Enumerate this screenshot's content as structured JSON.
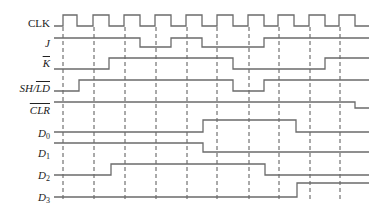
{
  "title": "",
  "colors": {
    "signal": "#6b6b6b",
    "dashed": "#555555",
    "label": "#222222"
  },
  "dashed_lines": {
    "x": [
      63,
      94,
      125,
      156,
      187,
      217,
      249,
      279,
      310,
      340
    ],
    "y_top": 27,
    "y_bottom": 200
  },
  "signals": [
    {
      "name": "CLK",
      "label": "CLK",
      "overline": false,
      "italic": false,
      "sub": "",
      "label_y": 23,
      "high_y": 15,
      "low_y": 26,
      "start_x": 54,
      "end_x": 369,
      "initial": 0,
      "edges": [
        63,
        77,
        93,
        109,
        124,
        140,
        155,
        171,
        186,
        202,
        217,
        233,
        248,
        264,
        278,
        294,
        309,
        325,
        339,
        355
      ]
    },
    {
      "name": "J",
      "label": "J",
      "overline": false,
      "italic": true,
      "sub": "",
      "label_y": 43,
      "high_y": 38,
      "low_y": 47,
      "start_x": 54,
      "end_x": 369,
      "initial": 1,
      "edges": [
        140,
        171,
        202,
        264
      ]
    },
    {
      "name": "K-bar",
      "label": "K",
      "overline": true,
      "italic": true,
      "sub": "",
      "label_y": 63,
      "high_y": 58,
      "low_y": 69,
      "start_x": 54,
      "end_x": 369,
      "initial": 0,
      "edges": [
        109,
        233,
        325
      ]
    },
    {
      "name": "SH-LD-bar",
      "label_parts": [
        "SH/",
        "LD"
      ],
      "label": "SH/LD",
      "overline": false,
      "italic": true,
      "sub": "",
      "label_y": 88,
      "high_y": 80,
      "low_y": 91,
      "start_x": 54,
      "end_x": 369,
      "initial": 0,
      "edges": [
        79,
        233,
        264
      ]
    },
    {
      "name": "CLR-bar",
      "label": "CLR",
      "overline": true,
      "italic": true,
      "sub": "",
      "label_y": 110,
      "high_y": 102,
      "low_y": 108,
      "start_x": 54,
      "end_x": 369,
      "initial": 1,
      "edges": [
        355
      ]
    },
    {
      "name": "D0",
      "label": "D",
      "overline": false,
      "italic": true,
      "sub": "0",
      "label_y": 133,
      "high_y": 120,
      "low_y": 132,
      "start_x": 54,
      "end_x": 369,
      "initial": 0,
      "edges": [
        203,
        296
      ]
    },
    {
      "name": "D1",
      "label": "D",
      "overline": false,
      "italic": true,
      "sub": "1",
      "label_y": 153,
      "high_y": 143,
      "low_y": 152,
      "start_x": 54,
      "end_x": 369,
      "initial": 1,
      "edges": [
        203
      ]
    },
    {
      "name": "D2",
      "label": "D",
      "overline": false,
      "italic": true,
      "sub": "2",
      "label_y": 175,
      "high_y": 164,
      "low_y": 175,
      "start_x": 54,
      "end_x": 369,
      "initial": 0,
      "edges": [
        111,
        265
      ]
    },
    {
      "name": "D3",
      "label": "D",
      "overline": false,
      "italic": true,
      "sub": "3",
      "label_y": 197,
      "high_y": 183,
      "low_y": 197,
      "start_x": 54,
      "end_x": 369,
      "initial": 0,
      "edges": [
        297
      ]
    }
  ]
}
